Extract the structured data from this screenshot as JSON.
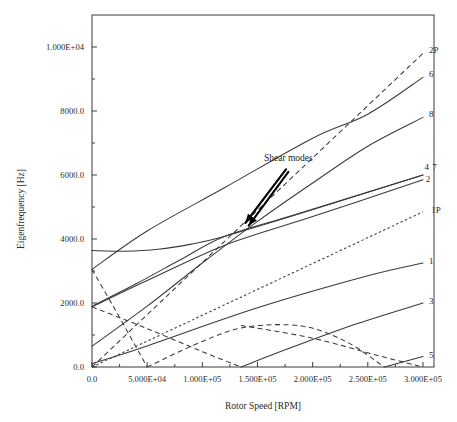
{
  "chart_data": {
    "type": "line",
    "title": "",
    "xlabel": "Rotor Speed [RPM]",
    "ylabel": "Eigenfrequency [Hz]",
    "xlim": [
      0,
      310000
    ],
    "ylim": [
      0,
      11000
    ],
    "grid": false,
    "legend_position": "right-of-curve-ends",
    "xticks": [
      0,
      50000,
      100000,
      150000,
      200000,
      250000,
      300000
    ],
    "xticklabels": [
      "0.0",
      "5.000E+04",
      "1.000E+05",
      "1.500E+05",
      "2.000E+05",
      "2.500E+05",
      "3.000E+05"
    ],
    "yticks": [
      0,
      2000,
      4000,
      6000,
      8000,
      10000
    ],
    "yticklabels": [
      "0.0",
      "2000.0",
      "4000.0",
      "6000.0",
      "8000.0",
      "1.000E+04"
    ],
    "minor_yticks": [
      1000,
      3000,
      5000,
      7000,
      9000
    ],
    "minor_xticks": [
      25000,
      75000,
      125000,
      175000,
      225000,
      275000
    ],
    "annotations": [
      {
        "text": "Shear modes",
        "x": 178000,
        "y": 6450,
        "arrows": [
          {
            "from_x": 176000,
            "from_y": 6180,
            "to_x": 139000,
            "to_y": 4500
          },
          {
            "from_x": 178000,
            "from_y": 6100,
            "to_x": 142000,
            "to_y": 4420
          }
        ]
      }
    ],
    "series": [
      {
        "name": "2P",
        "label": "2P",
        "style": "dashed",
        "description": "2x rotor speed excitation line, rises from origin",
        "x": [
          0,
          300000
        ],
        "y": [
          0,
          9800
        ]
      },
      {
        "name": "6",
        "label": "6",
        "style": "solid",
        "description": "mode 6, starts near 3050 Hz rising steeply",
        "x": [
          0,
          50000,
          120000,
          200000,
          250000,
          300000
        ],
        "y": [
          3050,
          4250,
          5600,
          7150,
          7900,
          9050
        ]
      },
      {
        "name": "8",
        "label": "8",
        "style": "solid",
        "description": "mode 8, starts near 650 Hz, steep rise",
        "x": [
          0,
          50000,
          100000,
          150000,
          200000,
          250000,
          300000
        ],
        "y": [
          650,
          1900,
          3250,
          4550,
          5750,
          6900,
          7800
        ]
      },
      {
        "name": "4",
        "label": "4",
        "style": "solid",
        "description": "shear mode 4, begins at 3640 Hz nearly flat then rises",
        "x": [
          0,
          30000,
          60000,
          90000,
          120000,
          180000,
          240000,
          300000
        ],
        "y": [
          3640,
          3620,
          3680,
          3840,
          4080,
          4700,
          5350,
          6000
        ]
      },
      {
        "name": "7",
        "label": "7",
        "style": "solid",
        "description": "shear mode 7, overlaps mode 4 near right edge",
        "x": [
          0,
          40000,
          80000,
          120000,
          180000,
          240000,
          300000
        ],
        "y": [
          1900,
          2600,
          3350,
          4080,
          4720,
          5360,
          6000
        ]
      },
      {
        "name": "2",
        "label": "2",
        "style": "solid",
        "description": "mode 2, rises from 1900 Hz to about 5850 Hz",
        "x": [
          0,
          50000,
          120000,
          200000,
          300000
        ],
        "y": [
          1880,
          2700,
          3800,
          4700,
          5850
        ]
      },
      {
        "name": "1P",
        "label": "1P",
        "style": "dotted",
        "description": "1x rotor speed excitation line from origin",
        "x": [
          0,
          300000
        ],
        "y": [
          0,
          4850
        ]
      },
      {
        "name": "1",
        "label": "1",
        "style": "solid",
        "description": "mode 1, from origin-ish to 3200 Hz",
        "x": [
          0,
          50000,
          150000,
          250000,
          300000
        ],
        "y": [
          100,
          660,
          1850,
          2850,
          3250
        ]
      },
      {
        "name": "3",
        "label": "3",
        "style": "solid",
        "description": "mode 3, crosses zero near 1.35E+05 then rises",
        "x": [
          135000,
          180000,
          240000,
          300000
        ],
        "y": [
          0,
          600,
          1350,
          2000
        ]
      },
      {
        "name": "5",
        "label": "5",
        "style": "solid",
        "description": "mode 5, touches zero near 2.65E+05 then rises",
        "x": [
          265000,
          300000
        ],
        "y": [
          0,
          330
        ]
      },
      {
        "name": "backward-1",
        "label": "",
        "style": "dashed",
        "description": "backward whirl branch descending from 3050 Hz to zero near 5.0E+04",
        "x": [
          0,
          20000,
          40000,
          50000
        ],
        "y": [
          3050,
          1850,
          620,
          0
        ]
      },
      {
        "name": "backward-2",
        "label": "",
        "style": "dashed",
        "description": "backward whirl branch descending from 1900 Hz crossing zero near 1.35E+05",
        "x": [
          0,
          50000,
          100000,
          135000
        ],
        "y": [
          1880,
          1200,
          480,
          0
        ]
      },
      {
        "name": "backward-3",
        "label": "",
        "style": "dashed",
        "description": "V-branch rising from zero at 5.0E+04 up to about 1300 Hz then descending to zero near 2.65E+05",
        "x": [
          50000,
          100000,
          140000,
          190000,
          230000,
          265000
        ],
        "y": [
          0,
          800,
          1250,
          1280,
          800,
          0
        ]
      },
      {
        "name": "backward-4",
        "label": "",
        "style": "dashed",
        "description": "descending branch from about 1300 Hz at 1.35E+05 down to zero at 3.0E+05",
        "x": [
          135000,
          200000,
          260000,
          300000
        ],
        "y": [
          1300,
          900,
          350,
          0
        ]
      }
    ]
  },
  "curve_labels": [
    {
      "text": "2P",
      "x": 300000,
      "y": 9900
    },
    {
      "text": "6",
      "x": 300000,
      "y": 9150
    },
    {
      "text": "8",
      "x": 300000,
      "y": 7900
    },
    {
      "text": "4",
      "x": 296000,
      "y": 6250
    },
    {
      "text": "7",
      "x": 303000,
      "y": 6250
    },
    {
      "text": "2",
      "x": 297000,
      "y": 5880
    },
    {
      "text": "1P",
      "x": 302000,
      "y": 4900
    },
    {
      "text": "1",
      "x": 300000,
      "y": 3320
    },
    {
      "text": "3",
      "x": 300000,
      "y": 2080
    },
    {
      "text": "5",
      "x": 300000,
      "y": 380
    }
  ],
  "colors": {
    "ink": "#3a3a3a",
    "text": "#2b2b2b",
    "arrow": "#000000",
    "background": "#ffffff"
  }
}
